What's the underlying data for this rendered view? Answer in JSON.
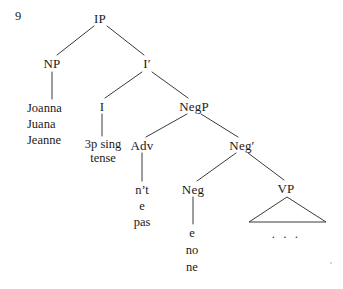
{
  "figure": {
    "example_number": "9",
    "ellipsis": ". . ."
  },
  "nodes": {
    "ip": {
      "label": "IP",
      "x": 100,
      "y": 18
    },
    "np": {
      "label": "NP",
      "x": 52,
      "y": 63
    },
    "ibar": {
      "label": "I′",
      "x": 147,
      "y": 63
    },
    "i": {
      "label": "I",
      "x": 102,
      "y": 106
    },
    "negp": {
      "label": "NegP",
      "x": 194,
      "y": 106
    },
    "adv": {
      "label": "Adv",
      "x": 142,
      "y": 145
    },
    "negbar": {
      "label": "Neg′",
      "x": 242,
      "y": 145
    },
    "neg": {
      "label": "Neg",
      "x": 193,
      "y": 189
    },
    "vp": {
      "label": "VP",
      "x": 286,
      "y": 188
    }
  },
  "leaves": {
    "np_words": {
      "x": 27,
      "y_start": 108,
      "line_height": 16,
      "items": [
        "Joanna",
        "Juana",
        "Jeanne"
      ]
    },
    "i_words": {
      "x": 103,
      "y_start": 144,
      "line_height": 14,
      "items": [
        "3p sing",
        "tense"
      ]
    },
    "adv_words": {
      "x": 142,
      "y_start": 190,
      "line_height": 16,
      "items": [
        "n’t",
        "e",
        "pas"
      ]
    },
    "neg_words": {
      "x": 192,
      "y_start": 233,
      "line_height": 17,
      "items": [
        "e",
        "no",
        "ne"
      ]
    }
  },
  "edges": [
    {
      "name": "ip-to-np",
      "x1": 94,
      "y1": 26,
      "x2": 57,
      "y2": 55
    },
    {
      "name": "ip-to-ibar",
      "x1": 107,
      "y1": 26,
      "x2": 144,
      "y2": 55
    },
    {
      "name": "np-to-joanna",
      "x1": 52,
      "y1": 72,
      "x2": 52,
      "y2": 99
    },
    {
      "name": "ibar-to-i",
      "x1": 142,
      "y1": 72,
      "x2": 105,
      "y2": 98
    },
    {
      "name": "ibar-to-negp",
      "x1": 152,
      "y1": 72,
      "x2": 188,
      "y2": 98
    },
    {
      "name": "i-to-tense",
      "x1": 102,
      "y1": 114,
      "x2": 102,
      "y2": 136
    },
    {
      "name": "negp-to-adv",
      "x1": 187,
      "y1": 114,
      "x2": 146,
      "y2": 137
    },
    {
      "name": "negp-to-negbar",
      "x1": 201,
      "y1": 114,
      "x2": 238,
      "y2": 137
    },
    {
      "name": "adv-to-nt",
      "x1": 142,
      "y1": 153,
      "x2": 142,
      "y2": 181
    },
    {
      "name": "negbar-to-neg",
      "x1": 236,
      "y1": 153,
      "x2": 197,
      "y2": 181
    },
    {
      "name": "negbar-to-vp",
      "x1": 248,
      "y1": 153,
      "x2": 284,
      "y2": 180
    },
    {
      "name": "neg-to-e",
      "x1": 193,
      "y1": 197,
      "x2": 193,
      "y2": 224
    }
  ],
  "triangle": {
    "name": "vp-triangle",
    "apex_x": 287,
    "apex_y": 197,
    "base_left_x": 249,
    "base_right_x": 326,
    "base_y": 222,
    "ellipsis_x": 286,
    "ellipsis_y": 233
  },
  "style": {
    "line_color": "#3a3a3a",
    "text_color": "#1a1a1a",
    "background": "#ffffff"
  }
}
